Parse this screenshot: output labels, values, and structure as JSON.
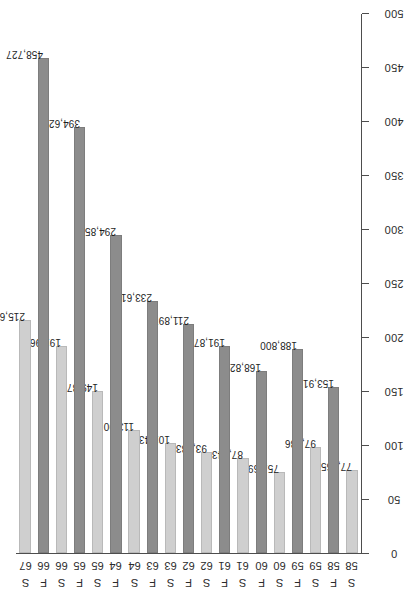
{
  "chart_data": {
    "type": "bar",
    "orientation": "horizontal",
    "title": "",
    "subtitle": "",
    "xlabel": "",
    "ylabel": "",
    "xlim": [
      0,
      500
    ],
    "ylim": null,
    "grid": false,
    "legend": null,
    "legend_position": "none",
    "axis_tick_labels": [
      "0",
      "50",
      "100",
      "150",
      "200",
      "250",
      "300",
      "350",
      "400",
      "450",
      "500"
    ],
    "axis_tick_values": [
      0,
      50,
      100,
      150,
      200,
      250,
      300,
      350,
      400,
      450,
      500
    ],
    "value_units": "thousands",
    "categories": [
      "S 58",
      "F 58",
      "S 59",
      "F 59",
      "S 60",
      "F 60",
      "S 61",
      "F 61",
      "S 62",
      "F 62",
      "S 63",
      "F 63",
      "S 64",
      "F 64",
      "S 65",
      "F 65",
      "S 66",
      "F 66",
      "S 67"
    ],
    "bars": [
      {
        "series": "S",
        "year": "58",
        "value": 77265,
        "label": "77,265"
      },
      {
        "series": "F",
        "year": "58",
        "value": 153919,
        "label": "153,919"
      },
      {
        "series": "S",
        "year": "59",
        "value": 97886,
        "label": "97,886"
      },
      {
        "series": "F",
        "year": "59",
        "value": 188800,
        "label": "188,800"
      },
      {
        "series": "S",
        "year": "60",
        "value": 75369,
        "label": "75,369"
      },
      {
        "series": "F",
        "year": "60",
        "value": 168827,
        "label": "168,827"
      },
      {
        "series": "S",
        "year": "61",
        "value": 87843,
        "label": "87,843"
      },
      {
        "series": "F",
        "year": "61",
        "value": 191876,
        "label": "191,876"
      },
      {
        "series": "S",
        "year": "62",
        "value": 93433,
        "label": "93,433"
      },
      {
        "series": "F",
        "year": "62",
        "value": 211897,
        "label": "211,897"
      },
      {
        "series": "S",
        "year": "63",
        "value": 101436,
        "label": "101,436"
      },
      {
        "series": "F",
        "year": "63",
        "value": 233612,
        "label": "233,612"
      },
      {
        "series": "S",
        "year": "64",
        "value": 113901,
        "label": "113,901"
      },
      {
        "series": "F",
        "year": "64",
        "value": 294855,
        "label": "294,855"
      },
      {
        "series": "S",
        "year": "65",
        "value": 149878,
        "label": "149,878"
      },
      {
        "series": "F",
        "year": "65",
        "value": 394621,
        "label": "394,621"
      },
      {
        "series": "S",
        "year": "66",
        "value": 191965,
        "label": "191,965"
      },
      {
        "series": "F",
        "year": "66",
        "value": 458727,
        "label": "458,727"
      },
      {
        "series": "S",
        "year": "67",
        "value": 215656,
        "label": "215,656"
      }
    ],
    "series": [
      {
        "name": "F",
        "color": "#8c8c8c"
      },
      {
        "name": "S",
        "color": "#cfcfcf"
      }
    ]
  },
  "colors": {
    "series_f": "#8c8c8c",
    "series_s": "#cfcfcf",
    "axis": "#4d4d4d",
    "text": "#1f1f1f",
    "background": "#ffffff"
  }
}
